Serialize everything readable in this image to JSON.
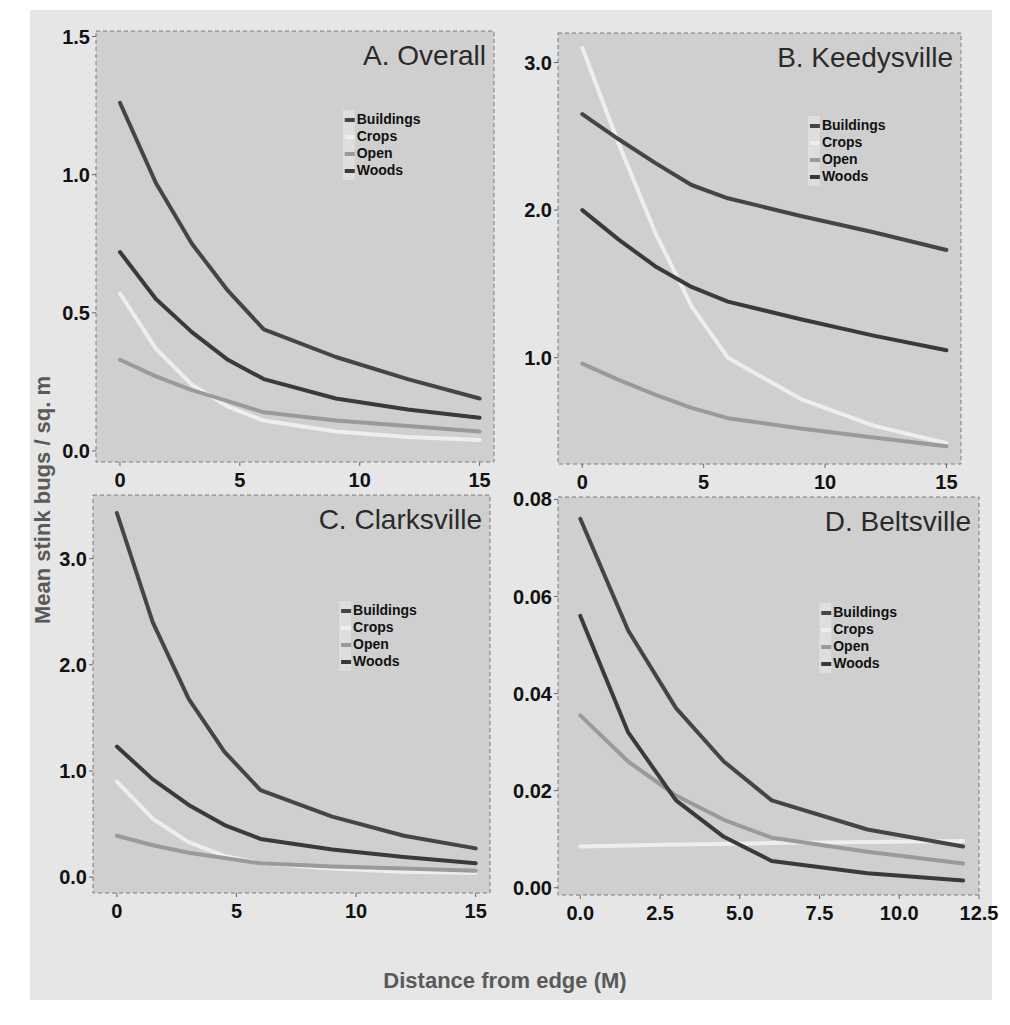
{
  "figure": {
    "ylabel": "Mean stink bugs / sq. m",
    "xlabel": "Distance from edge (M)"
  },
  "colors": {
    "Buildings": "#454545",
    "Crops": "#eeeeee",
    "Open": "#9a9a9a",
    "Woods": "#3a3a3a",
    "panel_bg": "#cfcfcf",
    "outer_bg": "#e6e6e6"
  },
  "legend": [
    "Buildings",
    "Crops",
    "Open",
    "Woods"
  ],
  "chart_data": [
    {
      "type": "line",
      "title": "A. Overall",
      "xlabel": "Distance from edge (M)",
      "ylabel": "Mean stink bugs / sq. m",
      "xlim": [
        -1.0,
        15.6
      ],
      "ylim": [
        -0.04,
        1.52
      ],
      "xticks": [
        0,
        5,
        10,
        15
      ],
      "xtick_labels": [
        "0",
        "5",
        "10",
        "15"
      ],
      "yticks": [
        0.0,
        0.5,
        1.0,
        1.5
      ],
      "ytick_labels": [
        "0.0",
        "0.5",
        "1.0",
        "1.5"
      ],
      "x": [
        0,
        1.5,
        3,
        4.5,
        6,
        9,
        12,
        15
      ],
      "series": [
        {
          "name": "Buildings",
          "values": [
            1.26,
            0.97,
            0.75,
            0.58,
            0.44,
            0.34,
            0.26,
            0.19
          ]
        },
        {
          "name": "Woods",
          "values": [
            0.72,
            0.55,
            0.43,
            0.33,
            0.26,
            0.19,
            0.15,
            0.12
          ]
        },
        {
          "name": "Open",
          "values": [
            0.33,
            0.27,
            0.22,
            0.18,
            0.14,
            0.11,
            0.09,
            0.07
          ]
        },
        {
          "name": "Crops",
          "values": [
            0.57,
            0.37,
            0.24,
            0.16,
            0.11,
            0.07,
            0.05,
            0.04
          ]
        }
      ],
      "legend_position": "upper right (inside)"
    },
    {
      "type": "line",
      "title": "B. Keedysville",
      "xlabel": "Distance from edge (M)",
      "ylabel": "Mean stink bugs / sq. m",
      "xlim": [
        -1.0,
        15.6
      ],
      "ylim": [
        0.28,
        3.2
      ],
      "xticks": [
        0,
        5,
        10,
        15
      ],
      "xtick_labels": [
        "0",
        "5",
        "10",
        "15"
      ],
      "yticks": [
        1.0,
        2.0,
        3.0
      ],
      "ytick_labels": [
        "1.0",
        "2.0",
        "3.0"
      ],
      "x": [
        0,
        1.5,
        3,
        4.5,
        6,
        9,
        12,
        15
      ],
      "series": [
        {
          "name": "Buildings",
          "values": [
            2.65,
            2.48,
            2.32,
            2.17,
            2.08,
            1.96,
            1.85,
            1.73
          ]
        },
        {
          "name": "Woods",
          "values": [
            2.0,
            1.8,
            1.62,
            1.48,
            1.38,
            1.26,
            1.15,
            1.05
          ]
        },
        {
          "name": "Open",
          "values": [
            0.96,
            0.85,
            0.75,
            0.66,
            0.59,
            0.52,
            0.46,
            0.4
          ]
        },
        {
          "name": "Crops",
          "values": [
            3.1,
            2.45,
            1.85,
            1.35,
            1.0,
            0.72,
            0.54,
            0.42
          ]
        }
      ],
      "legend_position": "upper right (inside)"
    },
    {
      "type": "line",
      "title": "C. Clarksville",
      "xlabel": "Distance from edge (M)",
      "ylabel": "Mean stink bugs / sq. m",
      "xlim": [
        -1.0,
        15.6
      ],
      "ylim": [
        -0.15,
        3.6
      ],
      "xticks": [
        0,
        5,
        10,
        15
      ],
      "xtick_labels": [
        "0",
        "5",
        "10",
        "15"
      ],
      "yticks": [
        0.0,
        1.0,
        2.0,
        3.0
      ],
      "ytick_labels": [
        "0.0",
        "1.0",
        "2.0",
        "3.0"
      ],
      "x": [
        0,
        1.5,
        3,
        4.5,
        6,
        9,
        12,
        15
      ],
      "series": [
        {
          "name": "Buildings",
          "values": [
            3.43,
            2.4,
            1.68,
            1.18,
            0.82,
            0.57,
            0.39,
            0.27
          ]
        },
        {
          "name": "Woods",
          "values": [
            1.23,
            0.92,
            0.68,
            0.49,
            0.36,
            0.26,
            0.19,
            0.13
          ]
        },
        {
          "name": "Open",
          "values": [
            0.39,
            0.3,
            0.23,
            0.18,
            0.13,
            0.1,
            0.08,
            0.06
          ]
        },
        {
          "name": "Crops",
          "values": [
            0.9,
            0.55,
            0.33,
            0.2,
            0.13,
            0.08,
            0.05,
            0.04
          ]
        }
      ],
      "legend_position": "upper right (inside)"
    },
    {
      "type": "line",
      "title": "D. Beltsville",
      "xlabel": "Distance from edge (M)",
      "ylabel": "Mean stink bugs / sq. m",
      "xlim": [
        -0.7,
        12.5
      ],
      "ylim": [
        -0.0015,
        0.0805
      ],
      "xticks": [
        0.0,
        2.5,
        5.0,
        7.5,
        10.0,
        12.5
      ],
      "xtick_labels": [
        "0.0",
        "2.5",
        "5.0",
        "7.5",
        "10.0",
        "12.5"
      ],
      "yticks": [
        0.0,
        0.02,
        0.04,
        0.06,
        0.08
      ],
      "ytick_labels": [
        "0.00",
        "0.02",
        "0.04",
        "0.06",
        "0.08"
      ],
      "x": [
        0,
        1.5,
        3,
        4.5,
        6,
        9,
        12
      ],
      "series": [
        {
          "name": "Buildings",
          "values": [
            0.076,
            0.053,
            0.037,
            0.026,
            0.018,
            0.012,
            0.0085
          ]
        },
        {
          "name": "Woods",
          "values": [
            0.056,
            0.032,
            0.018,
            0.0105,
            0.0055,
            0.003,
            0.0015
          ]
        },
        {
          "name": "Open",
          "values": [
            0.0355,
            0.026,
            0.019,
            0.014,
            0.0103,
            0.0074,
            0.005
          ]
        },
        {
          "name": "Crops",
          "values": [
            0.0085,
            0.0087,
            0.0089,
            0.009,
            0.0092,
            0.0094,
            0.0096
          ]
        }
      ],
      "legend_position": "upper right (inside)"
    }
  ]
}
